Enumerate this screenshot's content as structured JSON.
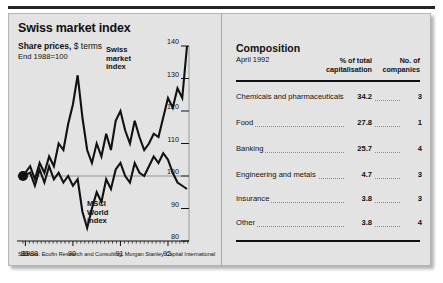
{
  "chart_panel": {
    "title": "Swiss market index",
    "subtitle_bold": "Share prices,",
    "subtitle_light": "$ terms",
    "subtitle2": "End 1988=100",
    "series_label_swiss": "Swiss\nmarket\nindex",
    "series_label_msci": "MSCI\nWorld\nindex",
    "source": "Sources: Ecofin Research and Consulting; Morgan Stanley Capital International"
  },
  "table_panel": {
    "title": "Composition",
    "date": "April 1992",
    "col_pct_header": "% of total\ncapitalisation",
    "col_no_header": "No. of\ncompanies",
    "rows": [
      {
        "name": "Chemicals and pharmaceuticals",
        "pct": "34.2",
        "companies": "3"
      },
      {
        "name": "Food",
        "pct": "27.8",
        "companies": "1"
      },
      {
        "name": "Banking",
        "pct": "25.7",
        "companies": "4"
      },
      {
        "name": "Engineering and metals",
        "pct": "4.7",
        "companies": "3"
      },
      {
        "name": "Insurance",
        "pct": "3.8",
        "companies": "3"
      },
      {
        "name": "Other",
        "pct": "3.8",
        "companies": "4"
      }
    ]
  },
  "chart_data": {
    "type": "line",
    "title": "Swiss market index",
    "subtitle": "Share prices, $ terms",
    "xlabel": "",
    "ylabel": "Index, End 1988=100",
    "ylim": [
      80,
      140
    ],
    "yticks": [
      80,
      90,
      100,
      110,
      120,
      130,
      140
    ],
    "xlim": [
      1988.95,
      1992.4
    ],
    "xticks": [
      1988,
      1989,
      1990,
      1991,
      1992
    ],
    "xtick_labels": [
      "1988",
      "89",
      "90",
      "91",
      "92"
    ],
    "grid": false,
    "baseline": 100,
    "legend": "inline-annotations",
    "start_marker": {
      "x": 1988.95,
      "y": 100
    },
    "series": [
      {
        "name": "Swiss market index",
        "color": "#111111",
        "x": [
          1988.95,
          1989.1,
          1989.2,
          1989.3,
          1989.4,
          1989.5,
          1989.6,
          1989.7,
          1989.8,
          1989.9,
          1990.0,
          1990.1,
          1990.2,
          1990.3,
          1990.4,
          1990.5,
          1990.6,
          1990.7,
          1990.8,
          1990.9,
          1991.0,
          1991.1,
          1991.2,
          1991.3,
          1991.4,
          1991.5,
          1991.6,
          1991.7,
          1991.8,
          1991.9,
          1992.0,
          1992.1,
          1992.2,
          1992.3,
          1992.4
        ],
        "values": [
          100,
          103,
          99,
          104,
          101,
          106,
          103,
          110,
          108,
          116,
          122,
          131,
          118,
          108,
          104,
          110,
          106,
          113,
          108,
          117,
          120,
          114,
          110,
          117,
          112,
          108,
          110,
          113,
          112,
          118,
          124,
          121,
          127,
          124,
          140
        ]
      },
      {
        "name": "MSCI World index",
        "color": "#111111",
        "x": [
          1988.95,
          1989.1,
          1989.2,
          1989.3,
          1989.4,
          1989.5,
          1989.6,
          1989.7,
          1989.8,
          1989.9,
          1990.0,
          1990.1,
          1990.2,
          1990.3,
          1990.4,
          1990.5,
          1990.6,
          1990.7,
          1990.8,
          1990.9,
          1991.0,
          1991.1,
          1991.2,
          1991.3,
          1991.4,
          1991.5,
          1991.6,
          1991.7,
          1991.8,
          1991.9,
          1992.0,
          1992.1,
          1992.2,
          1992.3,
          1992.4
        ],
        "values": [
          100,
          101,
          97,
          102,
          98,
          103,
          99,
          101,
          98,
          100,
          97,
          99,
          89,
          84,
          90,
          95,
          92,
          99,
          96,
          102,
          104,
          100,
          98,
          104,
          101,
          100,
          103,
          106,
          104,
          107,
          105,
          101,
          98,
          97,
          96
        ]
      }
    ]
  }
}
